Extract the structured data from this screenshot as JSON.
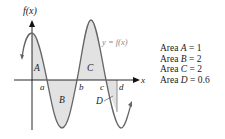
{
  "figure": {
    "y_axis_label": "f(x)",
    "x_axis_label": "x",
    "curve_label": "y = f(x)",
    "x_ticks": [
      "a",
      "b",
      "c",
      "d"
    ],
    "region_labels": [
      "A",
      "B",
      "C",
      "D"
    ]
  },
  "legend": {
    "rows": [
      {
        "prefix": "Area ",
        "name": "A",
        "value": " = 1"
      },
      {
        "prefix": "Area ",
        "name": "B",
        "value": " = 2"
      },
      {
        "prefix": "Area ",
        "name": "C",
        "value": " = 2"
      },
      {
        "prefix": "Area ",
        "name": "D",
        "value": " = 0.6"
      }
    ]
  },
  "colors": {
    "curve": "#666666",
    "shade": "#e2e2e2",
    "axis": "#111111"
  }
}
